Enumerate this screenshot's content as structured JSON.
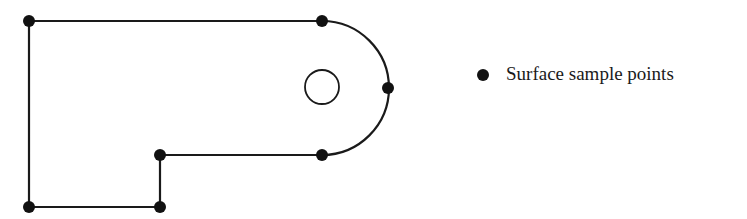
{
  "diagram": {
    "type": "part-outline-with-sample-points",
    "outline_color": "#1a1a1a",
    "outline_points": [
      {
        "name": "top-left",
        "x": 29,
        "y": 21
      },
      {
        "name": "top-right",
        "x": 322,
        "y": 21
      },
      {
        "name": "arc-right",
        "x": 388,
        "y": 88
      },
      {
        "name": "notch-right",
        "x": 322,
        "y": 155
      },
      {
        "name": "notch-left",
        "x": 160,
        "y": 155
      },
      {
        "name": "bottom-right",
        "x": 160,
        "y": 207
      },
      {
        "name": "bottom-left",
        "x": 29,
        "y": 207
      }
    ],
    "hole": {
      "cx": 322,
      "cy": 87,
      "r": 17
    }
  },
  "legend": {
    "marker": "filled-circle",
    "label": "Surface sample points"
  }
}
